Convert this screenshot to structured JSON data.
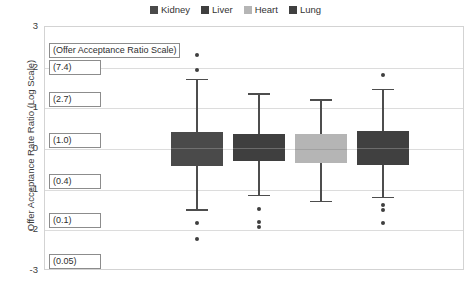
{
  "legend": {
    "items": [
      {
        "label": "Kidney",
        "color": "#4a4a4a"
      },
      {
        "label": "Liver",
        "color": "#3f3f3f"
      },
      {
        "label": "Heart",
        "color": "#b5b5b5"
      },
      {
        "label": "Lung",
        "color": "#404040"
      }
    ]
  },
  "axis": {
    "y_title": "Offer Acceptance Rate Ratio (Log Scale)",
    "y_ticks": [
      "3",
      "2",
      "1",
      "0",
      "-1",
      "-2",
      "-3"
    ]
  },
  "annotations": [
    {
      "text": "(Offer Acceptance Ratio Scale)",
      "value": null,
      "at": 2.45
    },
    {
      "text": "(7.4)",
      "value": 7.4,
      "at": 2.05
    },
    {
      "text": "(2.7)",
      "value": 2.7,
      "at": 1.25
    },
    {
      "text": "(1.0)",
      "value": 1.0,
      "at": 0.25
    },
    {
      "text": "(0.4)",
      "value": 0.4,
      "at": -0.75
    },
    {
      "text": "(0.1)",
      "value": 0.1,
      "at": -1.72
    },
    {
      "text": "(0.05)",
      "value": 0.05,
      "at": -2.72
    }
  ],
  "chart_data": {
    "type": "box",
    "title": "",
    "xlabel": "",
    "ylabel": "Offer Acceptance Rate Ratio (Log Scale)",
    "ylim": [
      -3,
      3
    ],
    "yticks": [
      3,
      2,
      1,
      0,
      -1,
      -2,
      -3
    ],
    "grid": true,
    "legend_position": "top-center",
    "secondary_scale": {
      "name": "Offer Acceptance Ratio Scale",
      "ticks": [
        {
          "log": 2,
          "ratio": 7.4
        },
        {
          "log": 1,
          "ratio": 2.7
        },
        {
          "log": 0,
          "ratio": 1.0
        },
        {
          "log": -1,
          "ratio": 0.4
        },
        {
          "log": -2,
          "ratio": 0.1
        },
        {
          "log": -3,
          "ratio": 0.05
        }
      ]
    },
    "categories": [
      "Kidney",
      "Liver",
      "Heart",
      "Lung"
    ],
    "series": [
      {
        "name": "Kidney",
        "color": "#4a4a4a",
        "whisker_high": 1.72,
        "q3": 0.42,
        "median": 0.02,
        "q1": -0.42,
        "whisker_low": -1.48,
        "outliers": [
          2.32,
          1.95,
          -1.82,
          -2.22
        ]
      },
      {
        "name": "Liver",
        "color": "#3f3f3f",
        "whisker_high": 1.37,
        "q3": 0.37,
        "median": 0.03,
        "q1": -0.3,
        "whisker_low": -1.13,
        "outliers": [
          -1.48,
          -1.8,
          -1.92
        ]
      },
      {
        "name": "Heart",
        "color": "#b5b5b5",
        "whisker_high": 1.22,
        "q3": 0.38,
        "median": 0.0,
        "q1": -0.35,
        "whisker_low": -1.28,
        "outliers": []
      },
      {
        "name": "Lung",
        "color": "#404040",
        "whisker_high": 1.48,
        "q3": 0.44,
        "median": 0.02,
        "q1": -0.4,
        "whisker_low": -1.18,
        "outliers": [
          1.82,
          -1.38,
          -1.5,
          -1.83
        ]
      }
    ]
  },
  "geometry": {
    "plot": {
      "left": 44,
      "top": 26,
      "width": 420,
      "height": 244
    },
    "box_width": 52,
    "centers": [
      196,
      258,
      320,
      382
    ]
  }
}
